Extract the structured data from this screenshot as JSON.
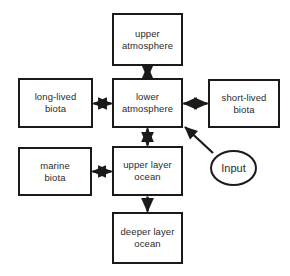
{
  "diagram": {
    "background_color": "#ffffff",
    "line_color": "#1a1a1a",
    "text_color": "#2b2b2b",
    "nodes": [
      {
        "id": "upper-atmosphere",
        "label": "upper\natmosphere",
        "shape": "rectangle",
        "x": 112,
        "y": 13,
        "w": 71,
        "h": 53
      },
      {
        "id": "lower-atmosphere",
        "label": "lower\natmosphere",
        "shape": "rectangle",
        "x": 112,
        "y": 78,
        "w": 71,
        "h": 50
      },
      {
        "id": "long-lived-biota",
        "label": "long-lived\nbiota",
        "shape": "rectangle",
        "x": 18,
        "y": 78,
        "w": 75,
        "h": 50
      },
      {
        "id": "short-lived-biota",
        "label": "short-lived\nbiota",
        "shape": "rectangle",
        "x": 208,
        "y": 79,
        "w": 72,
        "h": 49
      },
      {
        "id": "marine-biota",
        "label": "marine\nbiota",
        "shape": "rectangle",
        "x": 18,
        "y": 147,
        "w": 74,
        "h": 49
      },
      {
        "id": "upper-layer-ocean",
        "label": "upper layer\nocean",
        "shape": "rectangle",
        "x": 112,
        "y": 146,
        "w": 71,
        "h": 50
      },
      {
        "id": "deeper-layer-ocean",
        "label": "deeper layer\nocean",
        "shape": "rectangle",
        "x": 112,
        "y": 212,
        "w": 71,
        "h": 52
      },
      {
        "id": "input",
        "label": "Input",
        "shape": "ellipse",
        "x": 210,
        "y": 150,
        "w": 47,
        "h": 36
      }
    ],
    "edges": [
      {
        "id": "upper-atmosphere-lower-atmosphere",
        "from": "lower-atmosphere",
        "to": "upper-atmosphere",
        "direction": "bidirectional",
        "orientation": "vertical"
      },
      {
        "id": "long-lived-biota-lower-atmosphere",
        "from": "long-lived-biota",
        "to": "lower-atmosphere",
        "direction": "bidirectional",
        "orientation": "horizontal"
      },
      {
        "id": "lower-atmosphere-short-lived-biota",
        "from": "lower-atmosphere",
        "to": "short-lived-biota",
        "direction": "bidirectional",
        "orientation": "horizontal"
      },
      {
        "id": "lower-atmosphere-upper-layer-ocean",
        "from": "lower-atmosphere",
        "to": "upper-layer-ocean",
        "direction": "bidirectional",
        "orientation": "vertical"
      },
      {
        "id": "marine-biota-upper-layer-ocean",
        "from": "marine-biota",
        "to": "upper-layer-ocean",
        "direction": "bidirectional",
        "orientation": "horizontal"
      },
      {
        "id": "upper-layer-ocean-deeper-layer-ocean",
        "from": "upper-layer-ocean",
        "to": "deeper-layer-ocean",
        "direction": "unidirectional",
        "orientation": "vertical"
      },
      {
        "id": "input-lower-atmosphere",
        "from": "input",
        "to": "lower-atmosphere",
        "direction": "unidirectional",
        "orientation": "diagonal"
      }
    ]
  }
}
